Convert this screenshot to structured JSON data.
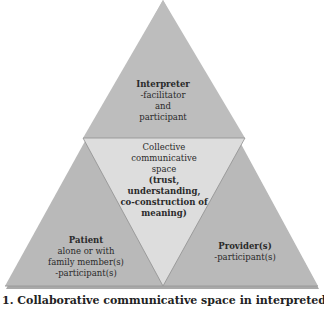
{
  "diagram": {
    "type": "triangle-model",
    "colors": {
      "outer_section": "#b9b9b9",
      "outer_section_shadow": "#a9a9a9",
      "center_section": "#dcdcdc",
      "edge": "#8a8a8a",
      "background": "#ffffff"
    },
    "interpreter": {
      "title": "Interpreter",
      "lines": [
        "-facilitator",
        "and",
        "participant"
      ]
    },
    "center": {
      "lines": [
        "Collective",
        "communicative",
        "space"
      ],
      "bold_lines": [
        "(trust,",
        "understanding,",
        "co-construction of",
        "meaning)"
      ]
    },
    "patient": {
      "title": "Patient",
      "lines": [
        "alone or with",
        "family member(s)",
        "-participant(s)"
      ]
    },
    "provider": {
      "title": "Provider(s)",
      "lines": [
        "-participant(s)"
      ]
    }
  },
  "caption": {
    "text": "1. Collaborative communicative space in interpreted"
  }
}
